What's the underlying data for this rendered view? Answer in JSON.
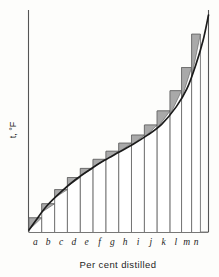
{
  "chart_data": {
    "type": "bar",
    "title": "",
    "subtitle": "",
    "xlabel": "Per cent distilled",
    "ylabel": "t, °F",
    "categories": [
      "a",
      "b",
      "c",
      "d",
      "e",
      "f",
      "g",
      "h",
      "i",
      "j",
      "k",
      "l",
      "m",
      "n"
    ],
    "values": [
      14,
      28,
      42,
      54,
      63,
      72,
      80,
      88,
      96,
      106,
      120,
      140,
      163,
      196
    ],
    "series": [
      {
        "name": "step bars (cut temperatures)",
        "values": [
          14,
          28,
          42,
          54,
          63,
          72,
          80,
          88,
          96,
          106,
          120,
          140,
          163,
          196
        ]
      },
      {
        "name": "smooth distillation curve",
        "x": [
          0,
          4,
          10,
          18,
          26,
          34,
          42,
          50,
          58,
          66,
          74,
          82,
          88,
          93,
          97,
          100
        ],
        "y": [
          2,
          12,
          26,
          40,
          52,
          62,
          71,
          79,
          87,
          96,
          107,
          124,
          142,
          166,
          190,
          215
        ]
      }
    ],
    "bar_edges_percent": [
      0,
      7.1,
      14.3,
      21.4,
      28.6,
      35.7,
      42.9,
      50.0,
      57.1,
      64.3,
      71.4,
      78.6,
      85.0,
      90.6,
      95.5,
      100
    ],
    "xlim": [
      0,
      100
    ],
    "ylim": [
      0,
      220
    ],
    "grid": false,
    "legend": false,
    "axis_ticks_shown": false,
    "colors": {
      "curve": "#1b1b1b",
      "bar_outline": "#6d6d6d",
      "triangle_fill": "#a9a9a9",
      "axis": "#555555",
      "background": "#fdfdfb"
    }
  }
}
